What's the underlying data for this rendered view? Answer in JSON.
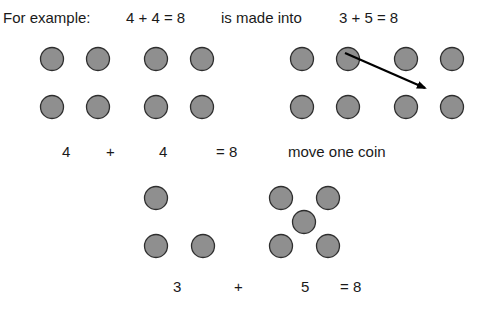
{
  "header": {
    "intro": "For example:",
    "original_equation": "4 + 4 = 8",
    "connector": "is made into",
    "new_equation": "3 + 5 = 8"
  },
  "middle_row": {
    "left_count": "4",
    "plus": "+",
    "right_count": "4",
    "equals": "= 8",
    "instruction": "move one coin"
  },
  "bottom_row": {
    "left_count": "3",
    "plus": "+",
    "right_count": "5",
    "equals": "= 8"
  },
  "colors": {
    "coin_fill": "#8f8f8f",
    "coin_stroke": "#2e2e2e",
    "arrow": "#000000"
  }
}
